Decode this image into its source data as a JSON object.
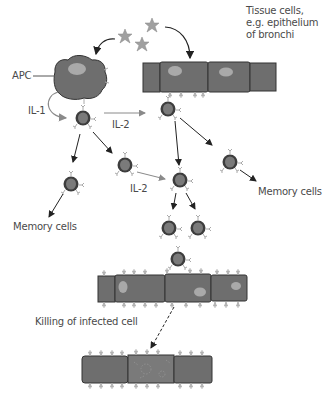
{
  "diagram": {
    "labels": {
      "tissue_cells": "Tissue cells,\ne.g. epithelium\nof bronchi",
      "apc": "APC",
      "il1": "IL-1",
      "il2_top": "IL-2",
      "il2_mid": "IL-2",
      "memory_left": "Memory cells",
      "memory_right": "Memory cells",
      "killing": "Killing of infected cell"
    },
    "colors": {
      "cell_fill": "#6e6e6e",
      "cell_outline": "#333333",
      "nucleus": "#a9a9a9",
      "lymph_outer": "#3d3d3d",
      "lymph_inner": "#7a7a7a",
      "antigen": "#9a9a9a",
      "arrow_dark": "#222222",
      "arrow_light": "#8a8a8a",
      "text": "#4a4a4a"
    }
  }
}
